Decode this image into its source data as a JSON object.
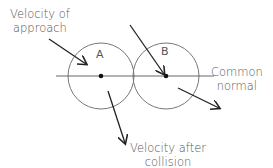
{
  "diagram": {
    "labels": {
      "approach": [
        "Velocity of",
        "approach"
      ],
      "after": [
        "Velocity after",
        "collision"
      ],
      "normal": [
        "Common",
        "normal"
      ]
    },
    "balls": [
      {
        "name": "A",
        "cx": 101,
        "cy": 76,
        "r": 33
      },
      {
        "name": "B",
        "cx": 166,
        "cy": 76,
        "r": 33
      }
    ],
    "colors": {
      "line": "#333333",
      "circle": "#777777",
      "text": "#555555"
    }
  }
}
